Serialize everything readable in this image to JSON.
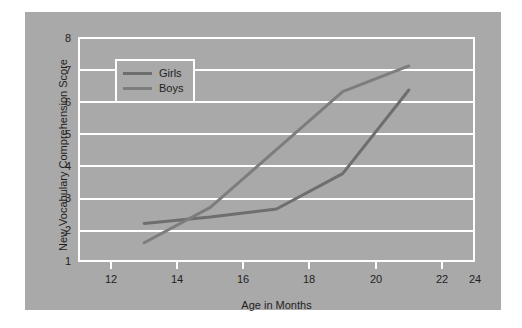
{
  "figure": {
    "background_color": "#a9a9a9",
    "gridline_color": "#ffffff",
    "page_background": "#ffffff"
  },
  "legend": {
    "position": "top-left-inside",
    "entries": [
      {
        "label": "Girls",
        "color": "#6e6e6e"
      },
      {
        "label": "Boys",
        "color": "#7d7d7d"
      }
    ]
  },
  "axes": {
    "x_title": "Age in Months",
    "y_title": "New Vocabulary Comprehension Score",
    "x_ticks": [
      "12",
      "14",
      "16",
      "18",
      "20",
      "22",
      "24"
    ],
    "y_ticks": [
      "1",
      "2",
      "3",
      "4",
      "5",
      "6",
      "7",
      "8"
    ]
  },
  "chart_data": {
    "type": "line",
    "title": "",
    "xlabel": "Age in Months",
    "ylabel": "New Vocabulary Comprehension Score",
    "xlim": [
      12,
      24
    ],
    "ylim": [
      1,
      8
    ],
    "xticks": [
      12,
      14,
      16,
      18,
      20,
      22,
      24
    ],
    "yticks": [
      1,
      2,
      3,
      4,
      5,
      6,
      7,
      8
    ],
    "grid": "horizontal",
    "legend_position": "upper left",
    "series": [
      {
        "name": "Girls",
        "color": "#6e6e6e",
        "x": [
          14,
          16,
          18,
          20,
          22
        ],
        "values": [
          2.2,
          2.4,
          2.65,
          3.75,
          6.35
        ]
      },
      {
        "name": "Boys",
        "color": "#7d7d7d",
        "x": [
          14,
          16,
          20,
          22
        ],
        "values": [
          1.6,
          2.7,
          6.3,
          7.1
        ]
      }
    ]
  }
}
